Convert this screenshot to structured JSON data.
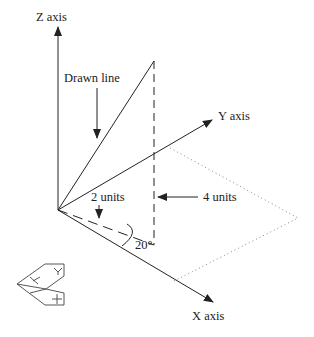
{
  "diagram": {
    "type": "3d-axis-illustration",
    "labels": {
      "z_axis": "Z axis",
      "y_axis": "Y axis",
      "x_axis": "X axis",
      "drawn_line": "Drawn line",
      "two_units": "2 units",
      "four_units": "4 units",
      "angle": "20°"
    },
    "icon": {
      "name": "ucs-icon",
      "y_mark": "Y",
      "x_mark": "+"
    },
    "colors": {
      "line": "#222222",
      "dotted": "#888888"
    }
  }
}
